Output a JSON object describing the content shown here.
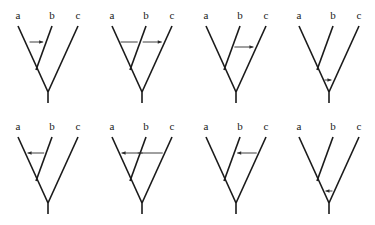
{
  "diagram": {
    "type": "phylogenetic-trees-horizontal-gene-transfer",
    "taxa": [
      "a",
      "b",
      "c"
    ],
    "topology": "((a,b),c)",
    "panels": [
      {
        "row": 1,
        "col": 1,
        "transfer": {
          "from": "a",
          "to": "b",
          "direction": "right",
          "level": "upper"
        }
      },
      {
        "row": 1,
        "col": 2,
        "transfer": {
          "from": "a",
          "to": "c",
          "direction": "right",
          "level": "upper",
          "crosses": "b"
        }
      },
      {
        "row": 1,
        "col": 3,
        "transfer": {
          "from": "b",
          "to": "c",
          "direction": "right",
          "level": "middle"
        }
      },
      {
        "row": 1,
        "col": 4,
        "transfer": {
          "from": "ab-ancestor",
          "to": "c",
          "direction": "right",
          "level": "lower"
        }
      },
      {
        "row": 2,
        "col": 1,
        "transfer": {
          "from": "b",
          "to": "a",
          "direction": "left",
          "level": "upper"
        }
      },
      {
        "row": 2,
        "col": 2,
        "transfer": {
          "from": "c",
          "to": "a",
          "direction": "left",
          "level": "upper",
          "crosses": "b"
        }
      },
      {
        "row": 2,
        "col": 3,
        "transfer": {
          "from": "c",
          "to": "b",
          "direction": "left",
          "level": "upper"
        }
      },
      {
        "row": 2,
        "col": 4,
        "transfer": {
          "from": "c",
          "to": "ab-ancestor",
          "direction": "left",
          "level": "lower"
        }
      }
    ]
  }
}
